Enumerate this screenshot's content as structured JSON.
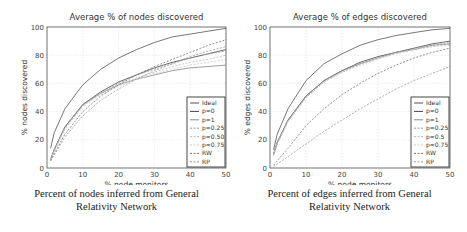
{
  "chart_data": [
    {
      "type": "line",
      "title": "Average % of nodes discovered",
      "xlabel": "% node monitors",
      "ylabel": "% nodes discovered",
      "xlim": [
        0,
        50
      ],
      "ylim": [
        0,
        100
      ],
      "xticks": [
        0,
        10,
        20,
        30,
        40,
        50
      ],
      "yticks": [
        0,
        20,
        40,
        60,
        80,
        100
      ],
      "grid": true,
      "legend_position": "lower right",
      "x": [
        1,
        2,
        5,
        10,
        15,
        20,
        25,
        30,
        35,
        40,
        45,
        50
      ],
      "series": [
        {
          "name": "Ideal",
          "style": "solid",
          "color": "#555555",
          "values": [
            14,
            25,
            42,
            59,
            70,
            78,
            84,
            89,
            93,
            95,
            97,
            99
          ]
        },
        {
          "name": "p=0",
          "style": "solid",
          "color": "#444444",
          "values": [
            6,
            13,
            29,
            45,
            54,
            61,
            66,
            71,
            75,
            78,
            81,
            84
          ]
        },
        {
          "name": "p=1",
          "style": "solid",
          "color": "#888888",
          "values": [
            6,
            13,
            29,
            45,
            53,
            59,
            63,
            66,
            69,
            71,
            72,
            73
          ]
        },
        {
          "name": "p=0.25",
          "style": "dashed",
          "color": "#999999",
          "values": [
            6,
            12,
            28,
            44,
            53,
            60,
            66,
            70,
            74,
            78,
            81,
            83
          ]
        },
        {
          "name": "p=0.50",
          "style": "dashed",
          "color": "#bbbbbb",
          "values": [
            6,
            12,
            28,
            44,
            53,
            59,
            64,
            68,
            72,
            75,
            77,
            80
          ]
        },
        {
          "name": "p=0.75",
          "style": "dashed",
          "color": "#cccccc",
          "values": [
            6,
            12,
            28,
            44,
            52,
            58,
            63,
            67,
            70,
            73,
            75,
            77
          ]
        },
        {
          "name": "RW",
          "style": "dashed",
          "color": "#777777",
          "values": [
            5,
            10,
            24,
            40,
            51,
            59,
            66,
            72,
            77,
            82,
            87,
            91
          ]
        },
        {
          "name": "RP",
          "style": "dashed",
          "color": "#999999",
          "values": [
            5,
            9,
            22,
            37,
            48,
            56,
            63,
            69,
            74,
            79,
            83,
            86
          ]
        }
      ]
    },
    {
      "type": "line",
      "title": "Average % of edges discovered",
      "xlabel": "% node monitors",
      "ylabel": "% edges discovered",
      "xlim": [
        0,
        50
      ],
      "ylim": [
        0,
        100
      ],
      "xticks": [
        0,
        10,
        20,
        30,
        40,
        50
      ],
      "yticks": [
        0,
        20,
        40,
        60,
        80,
        100
      ],
      "grid": true,
      "legend_position": "lower right",
      "x": [
        1,
        2,
        5,
        10,
        15,
        20,
        25,
        30,
        35,
        40,
        45,
        50
      ],
      "series": [
        {
          "name": "Ideal",
          "style": "solid",
          "color": "#555555",
          "values": [
            13,
            24,
            42,
            62,
            74,
            81,
            87,
            91,
            94,
            96,
            98,
            99
          ]
        },
        {
          "name": "p=0",
          "style": "solid",
          "color": "#444444",
          "values": [
            10,
            18,
            34,
            51,
            62,
            69,
            75,
            79,
            82,
            85,
            88,
            90
          ]
        },
        {
          "name": "p=1",
          "style": "solid",
          "color": "#888888",
          "values": [
            10,
            18,
            34,
            51,
            62,
            69,
            74,
            78,
            82,
            84,
            87,
            88
          ]
        },
        {
          "name": "p=0.25",
          "style": "dashed",
          "color": "#999999",
          "values": [
            9,
            17,
            33,
            50,
            61,
            68,
            74,
            78,
            82,
            85,
            87,
            89
          ]
        },
        {
          "name": "p=0.5",
          "style": "dashed",
          "color": "#bbbbbb",
          "values": [
            9,
            17,
            33,
            50,
            61,
            68,
            73,
            78,
            81,
            84,
            86,
            88
          ]
        },
        {
          "name": "p=0.75",
          "style": "dashed",
          "color": "#cccccc",
          "values": [
            9,
            17,
            33,
            50,
            61,
            68,
            73,
            77,
            81,
            84,
            86,
            87
          ]
        },
        {
          "name": "RW",
          "style": "dashed",
          "color": "#777777",
          "values": [
            2,
            5,
            14,
            30,
            42,
            52,
            60,
            67,
            73,
            78,
            82,
            85
          ]
        },
        {
          "name": "RP",
          "style": "dashed",
          "color": "#999999",
          "values": [
            1,
            3,
            8,
            17,
            26,
            34,
            42,
            49,
            56,
            62,
            67,
            72
          ]
        }
      ]
    }
  ],
  "captions": [
    {
      "line1": "Percent of nodes inferred from General",
      "line2": "Relativity Network"
    },
    {
      "line1": "Percent of edges inferred from General",
      "line2": "Relativity Network"
    }
  ]
}
